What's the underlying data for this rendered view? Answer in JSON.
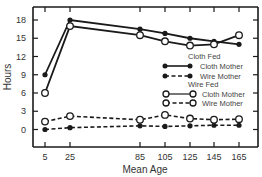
{
  "chart_data": {
    "type": "line",
    "title": "",
    "xlabel": "Mean Age",
    "ylabel": "Hours",
    "x": [
      5,
      25,
      85,
      105,
      125,
      145,
      165
    ],
    "x_tick_labels": [
      "5",
      "25",
      "85",
      "105",
      "125",
      "145",
      "165"
    ],
    "y_ticks": [
      0,
      3,
      6,
      9,
      12,
      15,
      18
    ],
    "ylim": [
      -2.5,
      20
    ],
    "grid": false,
    "legend_position": "inside right",
    "legend_groups": [
      {
        "title": "Cloth Fed",
        "entries": [
          "Cloth Mother",
          "Wire Mother"
        ]
      },
      {
        "title": "Wire Fed",
        "entries": [
          "Cloth Mother",
          "Wire Mother"
        ]
      }
    ],
    "series": [
      {
        "name": "Cloth Fed - Cloth Mother",
        "marker": "filled",
        "line": "solid",
        "values": [
          9,
          18,
          16.5,
          15.8,
          15,
          14.5,
          14
        ]
      },
      {
        "name": "Cloth Fed - Wire Mother",
        "marker": "filled",
        "line": "dashed",
        "values": [
          0,
          0.3,
          0.6,
          0.5,
          0.6,
          0.7,
          0.7
        ]
      },
      {
        "name": "Wire Fed - Cloth Mother",
        "marker": "open",
        "line": "solid",
        "values": [
          6,
          17,
          15.5,
          14.5,
          13.8,
          14,
          15.5
        ]
      },
      {
        "name": "Wire Fed - Wire Mother",
        "marker": "open",
        "line": "dashed",
        "values": [
          1.3,
          2.2,
          1.6,
          2.4,
          1.8,
          1.6,
          1.7
        ]
      }
    ]
  },
  "labels": {
    "xlabel": "Mean Age",
    "ylabel": "Hours",
    "legend_cloth_fed": "Cloth Fed",
    "legend_wire_fed": "Wire Fed",
    "legend_cloth_mother": "Cloth Mother",
    "legend_wire_mother": "Wire Mother"
  },
  "colors": {
    "line": "#1a1a1a",
    "axis": "#1a1a1a",
    "background": "#ffffff"
  }
}
